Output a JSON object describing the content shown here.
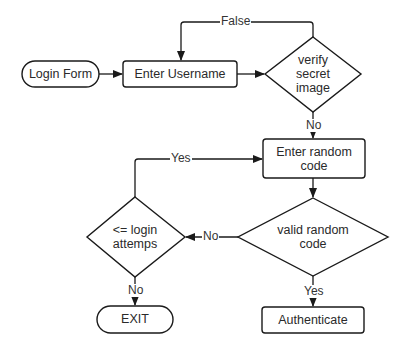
{
  "diagram": {
    "type": "flowchart",
    "nodes": {
      "login_form": {
        "label": "Login Form",
        "shape": "terminal"
      },
      "enter_username": {
        "label": "Enter Username",
        "shape": "process"
      },
      "verify_secret_image": {
        "label_lines": [
          "verify",
          "secret",
          "image"
        ],
        "shape": "decision"
      },
      "enter_random_code": {
        "label_lines": [
          "Enter random",
          "code"
        ],
        "shape": "process"
      },
      "valid_random_code": {
        "label_lines": [
          "valid random",
          "code"
        ],
        "shape": "decision"
      },
      "login_attempts": {
        "label_lines": [
          "<= login",
          "attemps"
        ],
        "shape": "decision"
      },
      "exit": {
        "label": "EXIT",
        "shape": "terminal"
      },
      "authenticate": {
        "label": "Authenticate",
        "shape": "process"
      }
    },
    "edges": {
      "false_loop": {
        "label": "False"
      },
      "verify_no": {
        "label": "No"
      },
      "attempts_yes": {
        "label": "Yes"
      },
      "valid_no": {
        "label": "No"
      },
      "attempts_no": {
        "label": "No"
      },
      "valid_yes": {
        "label": "Yes"
      }
    },
    "colors": {
      "stroke": "#1a1a1a",
      "background": "#ffffff",
      "text": "#2a2a2a"
    }
  }
}
